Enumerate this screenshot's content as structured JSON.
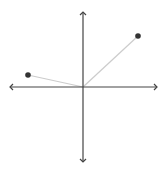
{
  "diagram": {
    "type": "coordinate-plane-vectors",
    "origin": [
      83,
      87
    ],
    "axes": {
      "x_from": 10,
      "x_to": 157,
      "y_from": 12,
      "y_to": 162,
      "color": "#444444"
    },
    "vectors": [
      {
        "name": "vector-upper-right",
        "tip": [
          138,
          36
        ],
        "line_color": "#cccccc"
      },
      {
        "name": "vector-upper-left",
        "tip": [
          28,
          75
        ],
        "line_color": "#cccccc"
      }
    ],
    "point_color": "#333333"
  }
}
